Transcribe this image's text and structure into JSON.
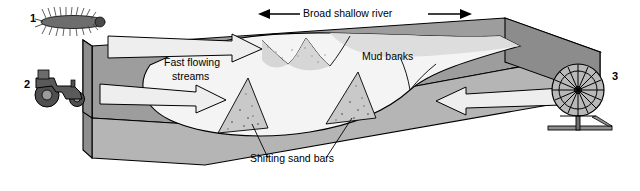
{
  "figure": {
    "title_top": "Broad shallow river",
    "labels": {
      "mud_banks": "Mud banks",
      "fast_flowing": "Fast flowing",
      "streams": "streams",
      "shifting_sand_bars": "Shifting sand bars"
    },
    "callouts": [
      {
        "number": "1",
        "name": "caterpillar-bristly-larva"
      },
      {
        "number": "2",
        "name": "tractor-silhouette"
      },
      {
        "number": "3",
        "name": "water-wheel"
      }
    ],
    "icon_names": {
      "arrow_left_head": "arrow-left-icon",
      "arrow_right_head": "arrow-right-icon",
      "flow_arrow": "flow-arrow-icon",
      "inflow_arrow": "inflow-arrow-icon"
    },
    "colors": {
      "outline": "#000000",
      "block_top_left": "#9a9a9a",
      "block_front": "#b4b4b4",
      "block_side": "#8a8a8a",
      "river": "#f2f2f2",
      "bank_shade": "#d8d8d8",
      "sand_bar": "#c9c9c9",
      "arrow_fill": "#ededed",
      "wheel": "#a8a8a8",
      "background": "#ffffff"
    }
  }
}
